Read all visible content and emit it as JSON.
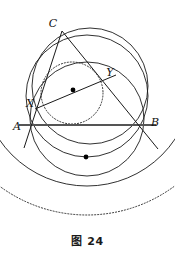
{
  "figure": {
    "caption": "图 24",
    "type": "geometry-diagram",
    "colors": {
      "stroke": "#1a1a1a",
      "background": "#ffffff",
      "point_fill": "#000000"
    },
    "labels": [
      {
        "name": "C",
        "text": "C",
        "x": 57,
        "y": 24
      },
      {
        "name": "Y",
        "text": "Y",
        "x": 110,
        "y": 73
      },
      {
        "name": "X",
        "text": "X",
        "x": 30,
        "y": 103
      },
      {
        "name": "A",
        "text": "A",
        "x": 18,
        "y": 126
      },
      {
        "name": "B",
        "text": "B",
        "x": 152,
        "y": 124
      }
    ],
    "vertices": {
      "A": {
        "x": 32,
        "y": 125
      },
      "B": {
        "x": 143,
        "y": 125
      },
      "C": {
        "x": 62,
        "y": 31
      },
      "X": {
        "x": 43,
        "y": 104
      },
      "Y": {
        "x": 105,
        "y": 79
      }
    },
    "marked_points": [
      {
        "name": "incircle-center-dot",
        "x": 73,
        "y": 90
      },
      {
        "name": "lower-arc-center-dot",
        "x": 86,
        "y": 157
      }
    ],
    "circles": [
      {
        "name": "circumcircle-ABC",
        "cx": 90,
        "cy": 86,
        "r": 58,
        "style": "solid"
      },
      {
        "name": "mixtilinear-circle-AYB",
        "cx": 87,
        "cy": 119,
        "r": 57,
        "style": "solid"
      },
      {
        "name": "tangent-circle-XY",
        "cx": 72,
        "cy": 93,
        "r": 31,
        "style": "dotted"
      },
      {
        "name": "lower-arc-circle-1",
        "cx": 87,
        "cy": 96,
        "r": 61,
        "style": "solid"
      },
      {
        "name": "lower-arc-circle-2",
        "cx": 87,
        "cy": 80,
        "r": 106,
        "style": "solid"
      },
      {
        "name": "lower-dotted-circle",
        "cx": 87,
        "cy": 68,
        "r": 147,
        "style": "dotted"
      }
    ],
    "segments": [
      {
        "name": "side-AB",
        "x1": 19,
        "y1": 125,
        "x2": 156,
        "y2": 125
      },
      {
        "name": "line-C-through-X",
        "x1": 62,
        "y1": 31,
        "x2": 24,
        "y2": 148
      },
      {
        "name": "line-C-through-Y",
        "x1": 62,
        "y1": 31,
        "x2": 158,
        "y2": 149
      },
      {
        "name": "line-X-to-Y",
        "x1": 35,
        "y1": 109,
        "x2": 116,
        "y2": 75
      }
    ]
  }
}
